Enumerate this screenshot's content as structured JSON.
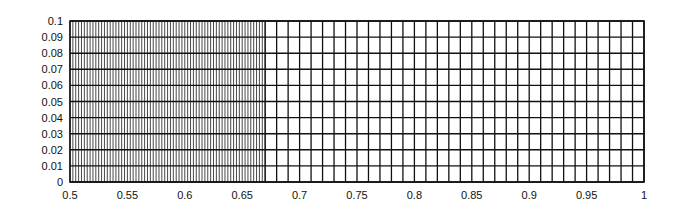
{
  "chart_data": {
    "type": "mesh",
    "title": "",
    "xlabel": "",
    "ylabel": "",
    "xlim": [
      0.5,
      1.0
    ],
    "ylim": [
      0,
      0.1
    ],
    "grid": true,
    "legend": null,
    "x_ticks": [
      "0.5",
      "0.55",
      "0.6",
      "0.65",
      "0.7",
      "0.75",
      "0.8",
      "0.85",
      "0.9",
      "0.95",
      "1"
    ],
    "y_ticks": [
      "0",
      "0.01",
      "0.02",
      "0.03",
      "0.04",
      "0.05",
      "0.06",
      "0.07",
      "0.08",
      "0.09",
      "0.1"
    ],
    "mesh": {
      "horizontal_lines_y_spacing": 0.01,
      "fine_region": {
        "x_start": 0.5,
        "x_end": 0.67,
        "x_spacing": 0.0025
      },
      "coarse_region": {
        "x_start": 0.67,
        "x_end": 1.0,
        "x_spacing": 0.01
      }
    },
    "line_color": "#111111",
    "fine_line_color": "#333333"
  }
}
